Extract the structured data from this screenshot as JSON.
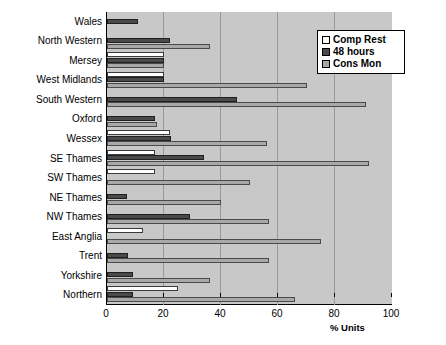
{
  "chart_data": {
    "type": "bar",
    "orientation": "horizontal",
    "title": "",
    "xlabel": "% Units",
    "ylabel": "",
    "xlim": [
      0,
      100
    ],
    "xticks": [
      0,
      20,
      40,
      60,
      80,
      100
    ],
    "grid": true,
    "legend_position": "top-right",
    "categories": [
      "Wales",
      "North Western",
      "Mersey",
      "West Midlands",
      "South Western",
      "Oxford",
      "Wessex",
      "SE Thames",
      "SW Thames",
      "NE Thames",
      "NW Thames",
      "East Anglia",
      "Trent",
      "Yorkshire",
      "Northern"
    ],
    "series": [
      {
        "name": "Comp Rest",
        "color": "#ffffff",
        "values": [
          0,
          0,
          20,
          20,
          0,
          0,
          22,
          17,
          17,
          0,
          0,
          12.5,
          0,
          0,
          25
        ]
      },
      {
        "name": "48 hours",
        "color": "#4a4a4a",
        "values": [
          11,
          22,
          20,
          20,
          45.5,
          17,
          22.5,
          34,
          0,
          7,
          29,
          0,
          7.5,
          9,
          9
        ]
      },
      {
        "name": "Cons Mon",
        "color": "#a8a8a8",
        "values": [
          0,
          36,
          20,
          70,
          91,
          17.5,
          56,
          92,
          50,
          40,
          57,
          75,
          57,
          36,
          66
        ]
      }
    ]
  },
  "legend": {
    "items": [
      {
        "label": "Comp Rest"
      },
      {
        "label": "48 hours"
      },
      {
        "label": "Cons Mon"
      }
    ]
  },
  "axis": {
    "x_title": "% Units",
    "tick_labels": [
      "0",
      "20",
      "40",
      "60",
      "80",
      "100"
    ]
  }
}
